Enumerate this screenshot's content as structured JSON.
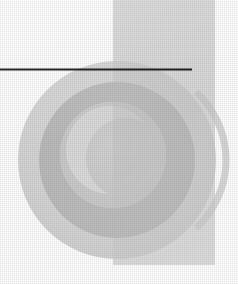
{
  "document": {
    "kind": "scanned-halftone-graphic",
    "title": "Abstract grayscale circular composition",
    "width_px": 238,
    "height_px": 284,
    "background_color": "#ffffff",
    "has_text": false,
    "text_content": ""
  },
  "palette": {
    "paper_white": "#ffffff",
    "lightest_grey": "#e4e4e4",
    "light_grey": "#d8d8d8",
    "mid_light_grey": "#cfcfcf",
    "mid_grey": "#c4c4c4",
    "mid_dark_grey": "#bcbcbc",
    "dark_grey": "#b2b2b2",
    "rule_black": "#1a1a1a"
  },
  "shapes": [
    {
      "name": "vertical-half-band",
      "type": "rect-clipped-band",
      "description": "Pale vertical band occupying the right half of the composition, running from top edge to lower area",
      "x": 113,
      "y": 0,
      "width": 102,
      "height": 265,
      "fill": "#d8d8d8"
    },
    {
      "name": "large-outer-disc",
      "type": "circle",
      "description": "Large light grey disc filling most of the frame",
      "cx": 117,
      "cy": 160,
      "r": 99,
      "fill": "#d8d8d8"
    },
    {
      "name": "mid-annulus-ring",
      "type": "annulus",
      "description": "Darker grey ring concentric inside the large disc",
      "cx": 117,
      "cy": 160,
      "r_outer": 78,
      "r_inner": 53,
      "fill": "#bcbcbc"
    },
    {
      "name": "inner-core-disc",
      "type": "circle",
      "description": "Lighter inner core disc at the centre of the ring",
      "cx": 113,
      "cy": 155,
      "r": 53,
      "fill": "#cfcfcf"
    },
    {
      "name": "upper-right-lobe",
      "type": "quarter-disc",
      "description": "Pale quarter-disc lobe in the upper right, above the horizontal rule",
      "cx": 113,
      "cy": 112,
      "r": 100,
      "fill": "#dcdcdc"
    },
    {
      "name": "inner-crescent-highlight",
      "type": "crescent",
      "description": "Soft lighter crescent sweeping through the inner core",
      "fill": "#dadada"
    }
  ],
  "rule": {
    "name": "horizontal-rule",
    "description": "Thin dark horizontal line crossing the upper portion of the image",
    "x_start": 0,
    "x_end": 192,
    "y": 69,
    "thickness_px": 2,
    "color": "#1a1a1a"
  },
  "texture": {
    "name": "halftone-dither",
    "description": "Fine crosshatch halftone dot grain from the printed/scanned original",
    "cell_px": 2,
    "opacity": 0.9
  }
}
